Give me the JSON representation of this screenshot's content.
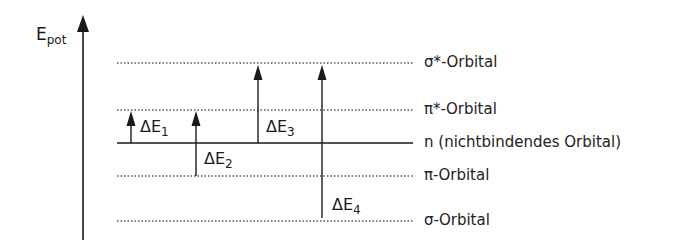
{
  "diagram": {
    "title": "",
    "axis": {
      "label_main": "E",
      "label_sub": "pot"
    },
    "levels": [
      {
        "id": "sigma-star",
        "label": "σ*-Orbital",
        "y": 63,
        "style": "dotted"
      },
      {
        "id": "pi-star",
        "label": "π*-Orbital",
        "y": 110,
        "style": "dotted"
      },
      {
        "id": "n",
        "label": "n (nichtbindendes Orbital)",
        "y": 143,
        "style": "solid"
      },
      {
        "id": "pi",
        "label": "π-Orbital",
        "y": 176,
        "style": "dotted"
      },
      {
        "id": "sigma",
        "label": "σ-Orbital",
        "y": 221,
        "style": "dotted"
      }
    ],
    "transitions": [
      {
        "id": "dE1",
        "label_main": "ΔE",
        "label_sub": "1",
        "from": "n",
        "to": "pi-star",
        "x": 131
      },
      {
        "id": "dE2",
        "label_main": "ΔE",
        "label_sub": "2",
        "from": "pi",
        "to": "pi-star",
        "x": 196
      },
      {
        "id": "dE3",
        "label_main": "ΔE",
        "label_sub": "3",
        "from": "n",
        "to": "sigma-star",
        "x": 258
      },
      {
        "id": "dE4",
        "label_main": "ΔE",
        "label_sub": "4",
        "from": "sigma",
        "to": "sigma-star",
        "x": 322
      }
    ],
    "colors": {
      "line": "#1a1a1a",
      "dotted": "#555555",
      "text": "#222222"
    }
  }
}
